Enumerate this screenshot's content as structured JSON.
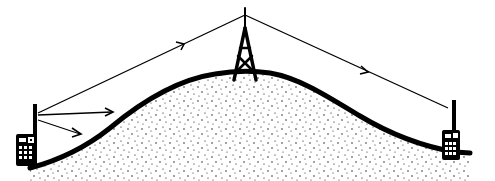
{
  "diagram": {
    "title": "",
    "background": "#ffffff",
    "ink": "#000000",
    "elements": [
      {
        "id": "hill",
        "type": "stippled-hill",
        "peak": [
          245,
          72
        ]
      },
      {
        "id": "tower",
        "type": "radio-tower",
        "position": [
          245,
          15
        ]
      },
      {
        "id": "radio-left",
        "type": "handheld-radio",
        "position": [
          22,
          140
        ]
      },
      {
        "id": "radio-right",
        "type": "handheld-radio",
        "position": [
          452,
          140
        ]
      },
      {
        "id": "signal-tower-left",
        "type": "arrow-line",
        "from": [
          245,
          16
        ],
        "to": [
          38,
          113
        ],
        "arrow_at": [
          183,
          44
        ]
      },
      {
        "id": "signal-tower-right",
        "type": "arrow-line",
        "from": [
          245,
          16
        ],
        "to": [
          447,
          108
        ],
        "arrow_at": [
          367,
          72
        ]
      },
      {
        "id": "signal-left-blocked-1",
        "type": "arrow-line",
        "from": [
          38,
          115
        ],
        "to": [
          113,
          112
        ]
      },
      {
        "id": "signal-left-blocked-2",
        "type": "arrow-line",
        "from": [
          38,
          120
        ],
        "to": [
          80,
          134
        ]
      }
    ]
  }
}
